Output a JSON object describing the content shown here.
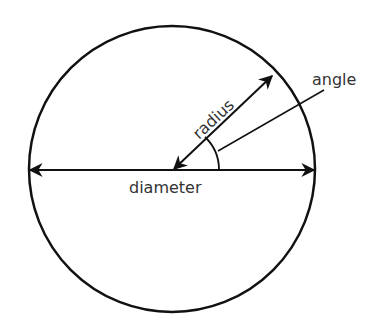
{
  "diagram": {
    "labels": {
      "radius": "radius",
      "angle": "angle",
      "diameter": "diameter"
    },
    "colors": {
      "stroke": "#111111",
      "text": "#333333",
      "background": "#ffffff"
    }
  }
}
